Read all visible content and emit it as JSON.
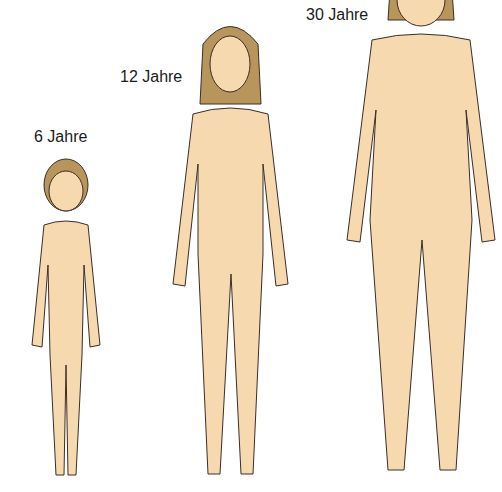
{
  "figures": [
    {
      "label": "6 Jahre",
      "age": 6
    },
    {
      "label": "12 Jahre",
      "age": 12
    },
    {
      "label": "30 Jahre",
      "age": 30
    }
  ],
  "colors": {
    "skin": "#f7d9b0",
    "outline": "#3a2e28",
    "hair": "#b8955a",
    "accent": "#c87a5a"
  }
}
